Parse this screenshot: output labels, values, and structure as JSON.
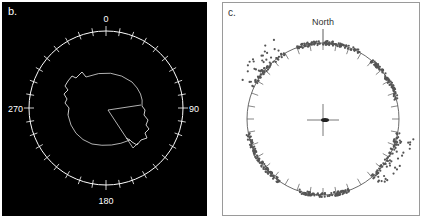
{
  "panels": {
    "b": {
      "label": "b.",
      "background": "#000000",
      "foreground": "#ffffff",
      "axis_labels": {
        "top": "0",
        "right": "90",
        "bottom": "180",
        "left": "270"
      }
    },
    "c": {
      "label": "c.",
      "background": "#ffffff",
      "foreground": "#333333",
      "point_color": "#555555",
      "north_label": "North"
    }
  },
  "chart_data": [
    {
      "type": "polar",
      "title": "b.",
      "angular_ticks": {
        "start": 0,
        "end": 350,
        "step": 10
      },
      "angular_labels": [
        "0",
        "90",
        "180",
        "270"
      ],
      "center": [
        104,
        106
      ],
      "radius": 77,
      "trace": "Irregular closed loop path (white) roughly elliptical, with jagged segments near 300-330° and 100-150°, plus a straight radial segment from center toward ~80° and another toward ~150°"
    },
    {
      "type": "scatter",
      "title": "c.",
      "annotation": "North",
      "circle_ticks_step_deg": 10,
      "center": [
        100,
        116
      ],
      "radius": 76,
      "clusters": [
        {
          "name": "north-cluster",
          "angle_range_deg": [
            340,
            30
          ]
        },
        {
          "name": "northwest-cluster",
          "angle_range_deg": [
            295,
            330
          ],
          "spread": "outward scatter"
        },
        {
          "name": "east-cluster",
          "angle_range_deg": [
            40,
            75
          ]
        },
        {
          "name": "southeast-cluster",
          "angle_range_deg": [
            100,
            140
          ],
          "spread": "outward scatter"
        },
        {
          "name": "south-cluster",
          "angle_range_deg": [
            160,
            200
          ]
        },
        {
          "name": "southwest-cluster",
          "angle_range_deg": [
            215,
            260
          ]
        }
      ],
      "center_marker": "crosshair with small dark cluster"
    }
  ]
}
